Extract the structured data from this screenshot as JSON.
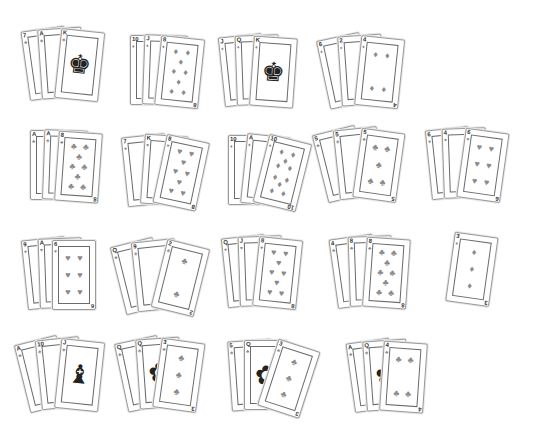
{
  "table": {
    "background": "#ffffff",
    "hands": [
      {
        "id": "h1",
        "x": 30,
        "y": 28,
        "cards": [
          {
            "rank": "7",
            "suit": "♣",
            "rot": -8
          },
          {
            "rank": "A",
            "suit": "♣",
            "rot": -4
          },
          {
            "rank": "K",
            "suit": "♣",
            "rot": 6,
            "face": "♚"
          }
        ]
      },
      {
        "id": "h2",
        "x": 130,
        "y": 35,
        "cards": [
          {
            "rank": "10",
            "suit": "♦",
            "rot": 0
          },
          {
            "rank": "J",
            "suit": "♦",
            "rot": 2
          },
          {
            "rank": "8",
            "suit": "♦",
            "rot": 6,
            "n": 8
          }
        ]
      },
      {
        "id": "h3",
        "x": 225,
        "y": 35,
        "cards": [
          {
            "rank": "J",
            "suit": "♦",
            "rot": -6
          },
          {
            "rank": "Q",
            "suit": "♦",
            "rot": -2
          },
          {
            "rank": "K",
            "suit": "♦",
            "rot": 4,
            "face": "♚"
          }
        ]
      },
      {
        "id": "h4",
        "x": 330,
        "y": 35,
        "cards": [
          {
            "rank": "6",
            "suit": "♦",
            "rot": -12
          },
          {
            "rank": "2",
            "suit": "♦",
            "rot": -4
          },
          {
            "rank": "4",
            "suit": "♦",
            "rot": 6,
            "n": 4
          }
        ]
      },
      {
        "id": "h5",
        "x": 30,
        "y": 130,
        "cards": [
          {
            "rank": "A",
            "suit": "♣",
            "rot": 0
          },
          {
            "rank": "A",
            "suit": "♣",
            "rot": 2
          },
          {
            "rank": "8",
            "suit": "♣",
            "rot": 4,
            "n": 8
          }
        ]
      },
      {
        "id": "h6",
        "x": 128,
        "y": 135,
        "cards": [
          {
            "rank": "7",
            "suit": "♥",
            "rot": -6
          },
          {
            "rank": "K",
            "suit": "♥",
            "rot": 4
          },
          {
            "rank": "8",
            "suit": "♥",
            "rot": 12,
            "n": 8
          }
        ]
      },
      {
        "id": "h7",
        "x": 228,
        "y": 135,
        "cards": [
          {
            "rank": "10",
            "suit": "♦",
            "rot": 0
          },
          {
            "rank": "A",
            "suit": "♦",
            "rot": 6
          },
          {
            "rank": "10",
            "suit": "♦",
            "rot": 14,
            "n": 10
          }
        ]
      },
      {
        "id": "h8",
        "x": 328,
        "y": 128,
        "cards": [
          {
            "rank": "5",
            "suit": "♣",
            "rot": -14
          },
          {
            "rank": "5",
            "suit": "♣",
            "rot": -6
          },
          {
            "rank": "5",
            "suit": "♣",
            "rot": 8,
            "n": 5
          }
        ]
      },
      {
        "id": "h9",
        "x": 432,
        "y": 128,
        "cards": [
          {
            "rank": "6",
            "suit": "♥",
            "rot": -6
          },
          {
            "rank": "4",
            "suit": "♥",
            "rot": -2
          },
          {
            "rank": "6",
            "suit": "♥",
            "rot": 8,
            "n": 6
          }
        ]
      },
      {
        "id": "h10",
        "x": 28,
        "y": 238,
        "cards": [
          {
            "rank": "9",
            "suit": "♥",
            "rot": -6
          },
          {
            "rank": "A",
            "suit": "♥",
            "rot": -2
          },
          {
            "rank": "6",
            "suit": "♥",
            "rot": 0,
            "n": 6
          }
        ]
      },
      {
        "id": "h11",
        "x": 126,
        "y": 240,
        "cards": [
          {
            "rank": "Q",
            "suit": "♣",
            "rot": -14
          },
          {
            "rank": "9",
            "suit": "♣",
            "rot": -6
          },
          {
            "rank": "2",
            "suit": "♣",
            "rot": 14,
            "n": 2
          }
        ]
      },
      {
        "id": "h12",
        "x": 228,
        "y": 236,
        "cards": [
          {
            "rank": "Q",
            "suit": "♥",
            "rot": -6
          },
          {
            "rank": "J",
            "suit": "♥",
            "rot": -2,
            "face": "♝"
          },
          {
            "rank": "8",
            "suit": "♥",
            "rot": 6,
            "n": 8
          }
        ]
      },
      {
        "id": "h13",
        "x": 338,
        "y": 236,
        "cards": [
          {
            "rank": "4",
            "suit": "♣",
            "rot": -8
          },
          {
            "rank": "8",
            "suit": "♣",
            "rot": -2
          },
          {
            "rank": "8",
            "suit": "♣",
            "rot": 4,
            "n": 8
          }
        ]
      },
      {
        "id": "h14",
        "x": 445,
        "y": 232,
        "cards": [
          {
            "rank": "3",
            "suit": "♦",
            "rot": 8,
            "n": 3
          }
        ]
      },
      {
        "id": "h15",
        "x": 30,
        "y": 338,
        "cards": [
          {
            "rank": "A",
            "suit": "♣",
            "rot": -14
          },
          {
            "rank": "10",
            "suit": "♣",
            "rot": -6
          },
          {
            "rank": "J",
            "suit": "♣",
            "rot": 6,
            "face": "♝"
          }
        ]
      },
      {
        "id": "h16",
        "x": 128,
        "y": 338,
        "cards": [
          {
            "rank": "Q",
            "suit": "♣",
            "rot": -12
          },
          {
            "rank": "Q",
            "suit": "♣",
            "rot": -4,
            "face": "✿"
          },
          {
            "rank": "3",
            "suit": "♣",
            "rot": 8,
            "n": 3
          }
        ]
      },
      {
        "id": "h17",
        "x": 232,
        "y": 340,
        "cards": [
          {
            "rank": "5",
            "suit": "♣",
            "rot": -4
          },
          {
            "rank": "Q",
            "suit": "♣",
            "rot": 0,
            "face": "✿"
          },
          {
            "rank": "3",
            "suit": "♣",
            "rot": 18,
            "n": 3
          }
        ]
      },
      {
        "id": "h18",
        "x": 355,
        "y": 340,
        "cards": [
          {
            "rank": "A",
            "suit": "♣",
            "rot": -8
          },
          {
            "rank": "Q",
            "suit": "♣",
            "rot": -4,
            "face": "✿"
          },
          {
            "rank": "4",
            "suit": "♣",
            "rot": 4,
            "n": 4
          }
        ]
      }
    ]
  }
}
